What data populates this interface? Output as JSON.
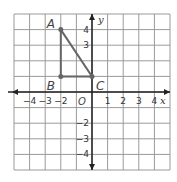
{
  "diagram": {
    "type": "coordinate-plane",
    "x_axis_label": "x",
    "y_axis_label": "y",
    "origin_label": "O",
    "x_range": [
      -5,
      5
    ],
    "y_range": [
      -5,
      5
    ],
    "x_ticks": [
      {
        "value": -4,
        "label": "−4"
      },
      {
        "value": -3,
        "label": "−3"
      },
      {
        "value": -2,
        "label": "−2"
      },
      {
        "value": 1,
        "label": "1"
      },
      {
        "value": 2,
        "label": "2"
      },
      {
        "value": 3,
        "label": "3"
      },
      {
        "value": 4,
        "label": "4"
      }
    ],
    "y_ticks": [
      {
        "value": 4,
        "label": "4"
      },
      {
        "value": 3,
        "label": "3"
      },
      {
        "value": -2,
        "label": "−2"
      },
      {
        "value": -3,
        "label": "−3"
      },
      {
        "value": -4,
        "label": "−4"
      }
    ],
    "points": [
      {
        "name": "A",
        "x": -2,
        "y": 4
      },
      {
        "name": "B",
        "x": -2,
        "y": 1
      },
      {
        "name": "C",
        "x": 0,
        "y": 1
      }
    ],
    "shape": "triangle ABC",
    "colors": {
      "grid": "#9a9a9a",
      "axis": "#222222",
      "triangle": "#666666"
    }
  }
}
